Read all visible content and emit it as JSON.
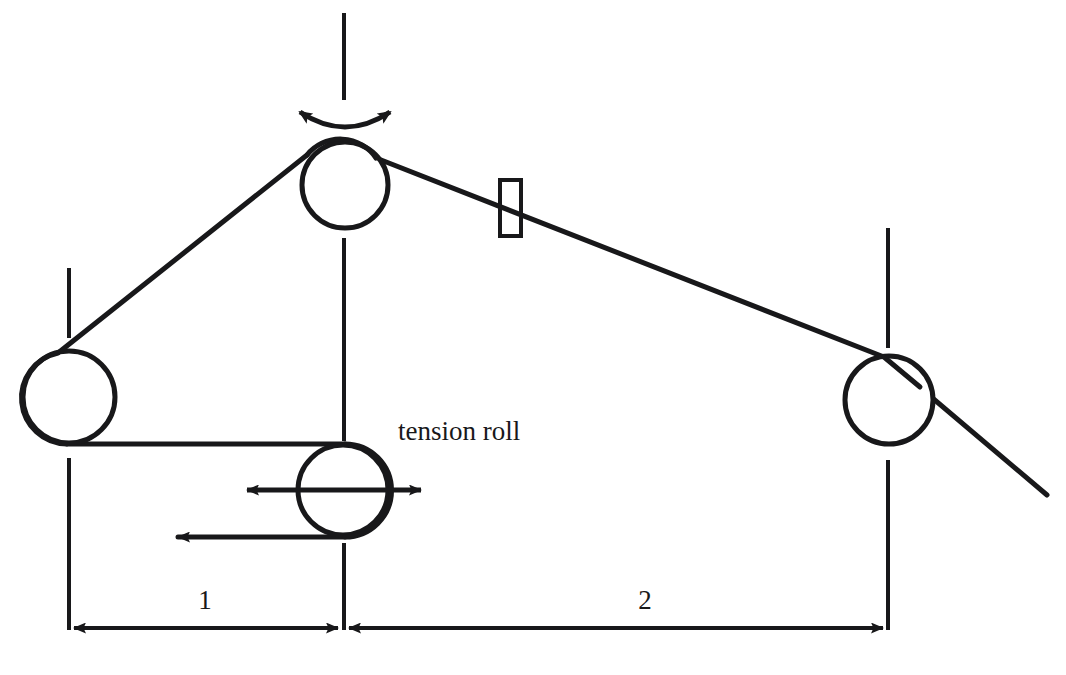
{
  "diagram": {
    "type": "web-handling-schematic",
    "stroke_color": "#18181a",
    "background_color": "#ffffff",
    "labels": {
      "tension_roll": "tension roll",
      "span_1": "1",
      "span_2": "2"
    },
    "rollers": [
      {
        "name": "left-roller",
        "cx": 69,
        "cy": 397,
        "r": 46,
        "centerline": true
      },
      {
        "name": "top-driven-roller",
        "cx": 345,
        "cy": 185,
        "r": 43,
        "centerline": true,
        "rotation_arrow": "bidirectional-curved"
      },
      {
        "name": "tension-roll",
        "cx": 343,
        "cy": 490,
        "r": 45,
        "centerline": true,
        "travel_arrow": "bidirectional-horizontal"
      },
      {
        "name": "right-roller",
        "cx": 889,
        "cy": 400,
        "r": 44,
        "centerline": true
      }
    ],
    "sensor": {
      "name": "web-sensor-gauge",
      "x": 500,
      "y": 180,
      "width": 21,
      "height": 56,
      "shape": "rectangle"
    },
    "dimensions": [
      {
        "name": "span-1",
        "label": "1",
        "from_x": 68,
        "to_x": 343,
        "y": 628,
        "label_x": 205,
        "label_y": 608
      },
      {
        "name": "span-2",
        "label": "2",
        "from_x": 343,
        "to_x": 888,
        "y": 628,
        "label_x": 645,
        "label_y": 608
      }
    ],
    "web_path": {
      "description": "Web travels from left roller up over top roller, down across sensor to right roller, then exits down-right; return pass runs from left roller bottom around tension roll and exits left",
      "exit_arrow_x": 172,
      "exit_arrow_y": 537
    }
  }
}
